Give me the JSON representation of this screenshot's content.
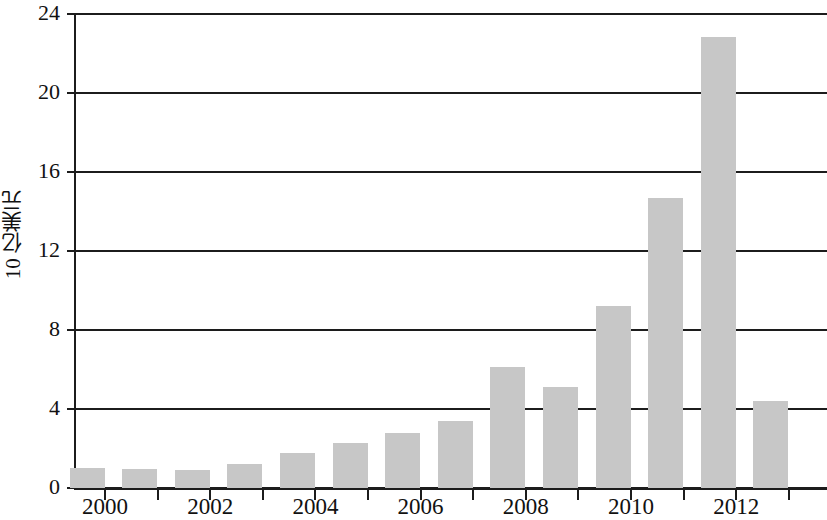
{
  "chart_data": {
    "type": "bar",
    "title": "",
    "xlabel": "",
    "ylabel": "10 亿美元",
    "ylim": [
      0,
      24
    ],
    "ytick_values": [
      0,
      4,
      8,
      12,
      16,
      20,
      24
    ],
    "ytick_labels": [
      "0",
      "4",
      "8",
      "12",
      "16",
      "20",
      "24"
    ],
    "grid": true,
    "legend": null,
    "categories": [
      "2000",
      "2001",
      "2002",
      "2003",
      "2004",
      "2005",
      "2006",
      "2007",
      "2008",
      "2009",
      "2010",
      "2011",
      "2012",
      "2013"
    ],
    "xtick_labels_shown": [
      "2000",
      "2002",
      "2004",
      "2006",
      "2008",
      "2010",
      "2012"
    ],
    "values": [
      1.0,
      0.95,
      0.9,
      1.2,
      1.75,
      2.3,
      2.8,
      3.4,
      6.15,
      5.1,
      9.2,
      14.7,
      22.85,
      4.4
    ],
    "bar_color": "#c7c7c7",
    "axis_color": "#1c1c1c"
  },
  "axis": {
    "y_title": "10 亿美元"
  }
}
